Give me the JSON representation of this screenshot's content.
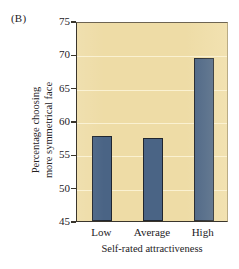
{
  "panel": {
    "label": "(B)"
  },
  "chart_data": {
    "type": "bar",
    "title": "",
    "panel_label": "(B)",
    "categories": [
      "Low",
      "Average",
      "High"
    ],
    "values": [
      57.7,
      57.4,
      69.4
    ],
    "series": [
      {
        "name": "Percentage choosing more symmetrical face",
        "values": [
          57.7,
          57.4,
          69.4
        ]
      }
    ],
    "xlabel": "Self-rated attractiveness",
    "ylabel": "Percentage choosing more symmetrical face",
    "ylabel_lines": [
      "Percentage choosing",
      "more symmetrical face"
    ],
    "ylim": [
      45,
      75
    ],
    "yticks": [
      45,
      50,
      55,
      60,
      65,
      70,
      75
    ],
    "ytick_labels": [
      "45",
      "50",
      "55",
      "60",
      "65",
      "70",
      "75"
    ],
    "grid": true,
    "grid_axis": "y",
    "legend": "none",
    "colors": {
      "bar_fill": "#4a6485",
      "bar_edge": "#20262f",
      "plot_background": "#eedca6",
      "gridline": "#fffae2",
      "axis": "#3a352c",
      "text": "#24211e",
      "page_background": "#ffffff"
    }
  }
}
